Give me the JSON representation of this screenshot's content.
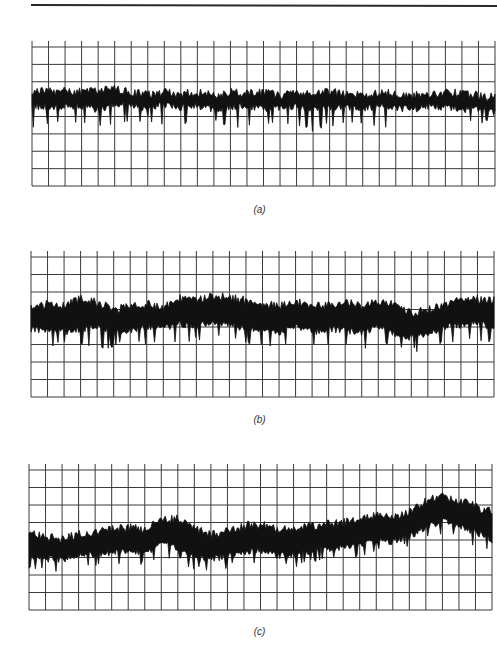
{
  "figure": {
    "panels": [
      {
        "id": "a",
        "label": "(a)"
      },
      {
        "id": "b",
        "label": "(b)"
      },
      {
        "id": "c",
        "label": "(c)"
      }
    ]
  },
  "chart_data": [
    {
      "type": "line",
      "title": "(a)",
      "xlabel": "",
      "ylabel": "",
      "grid": true,
      "grid_columns": 28,
      "grid_rows": 8,
      "ylim": [
        0,
        8
      ],
      "description": "Noise trace, roughly flat, centered ~5.2 grid units from bottom, band width ~1 unit, frequent downward spikes to ~3.5",
      "x": [
        0,
        1,
        2,
        3,
        4,
        5,
        6,
        7,
        8,
        9,
        10,
        11,
        12,
        13,
        14,
        15,
        16,
        17,
        18,
        19,
        20,
        21,
        22,
        23,
        24,
        25,
        26,
        27,
        28
      ],
      "series": [
        {
          "name": "upper",
          "values": [
            5.5,
            5.4,
            5.5,
            5.4,
            5.5,
            5.6,
            5.4,
            5.3,
            5.4,
            5.3,
            5.4,
            5.2,
            5.4,
            5.3,
            5.4,
            5.2,
            5.3,
            5.4,
            5.5,
            5.3,
            5.2,
            5.4,
            5.3,
            5.2,
            5.3,
            5.4,
            5.3,
            5.2,
            5.1
          ]
        },
        {
          "name": "lower",
          "values": [
            4.6,
            4.5,
            4.6,
            4.6,
            4.4,
            4.7,
            4.6,
            4.5,
            4.7,
            4.5,
            4.6,
            4.4,
            4.5,
            4.6,
            4.4,
            4.5,
            4.6,
            4.4,
            4.5,
            4.5,
            4.4,
            4.6,
            4.5,
            4.4,
            4.6,
            4.5,
            4.4,
            4.4,
            4.2
          ]
        },
        {
          "name": "spike_min",
          "values": [
            3.6,
            3.8,
            3.7,
            4.0,
            3.5,
            3.9,
            3.8,
            4.0,
            3.6,
            3.8,
            3.7,
            3.9,
            3.5,
            3.7,
            3.8,
            3.9,
            3.6,
            3.4,
            3.7,
            3.8,
            3.9,
            3.5,
            3.8,
            3.7,
            3.9,
            3.8,
            3.6,
            3.9,
            3.8
          ]
        }
      ]
    },
    {
      "type": "line",
      "title": "(b)",
      "xlabel": "",
      "ylabel": "",
      "grid": true,
      "grid_columns": 28,
      "grid_rows": 8,
      "ylim": [
        0,
        8
      ],
      "description": "Noise trace with wider band (~2 units), slow wander, centered ~4.5 units",
      "x": [
        0,
        1,
        2,
        3,
        4,
        5,
        6,
        7,
        8,
        9,
        10,
        11,
        12,
        13,
        14,
        15,
        16,
        17,
        18,
        19,
        20,
        21,
        22,
        23,
        24,
        25,
        26,
        27,
        28
      ],
      "series": [
        {
          "name": "upper",
          "values": [
            5.1,
            5.3,
            5.2,
            5.6,
            5.4,
            5.0,
            5.2,
            5.3,
            5.2,
            5.6,
            5.5,
            5.8,
            5.7,
            5.5,
            5.3,
            5.2,
            5.5,
            5.1,
            5.3,
            5.4,
            5.2,
            5.5,
            5.3,
            4.8,
            5.0,
            5.3,
            5.5,
            5.6,
            5.5
          ]
        },
        {
          "name": "lower",
          "values": [
            3.9,
            3.8,
            3.7,
            3.9,
            4.0,
            3.7,
            3.8,
            4.0,
            3.9,
            4.2,
            4.0,
            4.3,
            4.1,
            3.9,
            3.8,
            3.7,
            4.0,
            3.7,
            3.9,
            3.8,
            3.7,
            4.0,
            3.6,
            3.4,
            3.6,
            4.0,
            4.1,
            4.2,
            4.0
          ]
        },
        {
          "name": "spike_min",
          "values": [
            3.2,
            3.1,
            3.3,
            3.2,
            2.9,
            3.1,
            3.2,
            3.3,
            3.3,
            3.5,
            3.4,
            3.6,
            3.5,
            3.2,
            3.1,
            3.0,
            3.3,
            3.1,
            3.2,
            3.1,
            3.0,
            3.2,
            3.0,
            2.8,
            3.0,
            3.3,
            3.4,
            3.5,
            3.4
          ]
        }
      ]
    },
    {
      "type": "line",
      "title": "(c)",
      "xlabel": "",
      "ylabel": "",
      "grid": true,
      "grid_columns": 28,
      "grid_rows": 8,
      "ylim": [
        0,
        8
      ],
      "description": "Noise trace with wide band (~2 units) and upward drift toward the right, peak near x=25",
      "x": [
        0,
        1,
        2,
        3,
        4,
        5,
        6,
        7,
        8,
        9,
        10,
        11,
        12,
        13,
        14,
        15,
        16,
        17,
        18,
        19,
        20,
        21,
        22,
        23,
        24,
        25,
        26,
        27,
        28
      ],
      "series": [
        {
          "name": "upper",
          "values": [
            4.4,
            4.2,
            4.1,
            4.3,
            4.4,
            4.6,
            4.7,
            4.6,
            5.2,
            5.2,
            4.7,
            4.3,
            4.5,
            4.8,
            4.9,
            4.6,
            4.7,
            4.8,
            4.9,
            5.0,
            5.1,
            5.4,
            5.3,
            5.6,
            6.2,
            6.5,
            6.3,
            5.9,
            5.6
          ]
        },
        {
          "name": "lower",
          "values": [
            3.0,
            2.9,
            2.9,
            3.1,
            3.2,
            3.3,
            3.4,
            3.3,
            3.7,
            3.6,
            3.0,
            2.9,
            3.1,
            3.3,
            3.4,
            3.1,
            3.2,
            3.3,
            3.5,
            3.6,
            3.7,
            3.9,
            3.9,
            4.2,
            4.7,
            5.1,
            4.8,
            4.4,
            4.0
          ]
        },
        {
          "name": "spike_min",
          "values": [
            2.5,
            2.4,
            2.3,
            2.6,
            2.7,
            2.8,
            2.9,
            2.8,
            3.2,
            3.1,
            2.5,
            2.4,
            2.7,
            2.9,
            3.0,
            2.6,
            2.7,
            2.9,
            3.1,
            3.2,
            3.3,
            3.5,
            3.5,
            3.9,
            4.3,
            4.6,
            4.3,
            3.9,
            3.6
          ]
        }
      ]
    }
  ]
}
